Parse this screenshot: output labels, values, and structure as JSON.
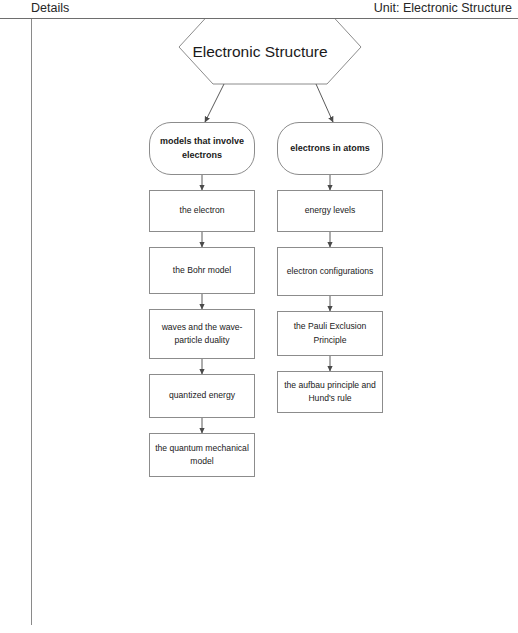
{
  "header": {
    "left_label": "Details",
    "right_label": "Unit: Electronic Structure"
  },
  "diagram": {
    "type": "concept-map",
    "title_node": {
      "label": "Electronic Structure",
      "shape": "hexagon"
    },
    "branches": [
      {
        "label": "models that involve electrons",
        "shape": "rounded-rectangle",
        "children": [
          "the electron",
          "the Bohr model",
          "waves and the wave-particle duality",
          "quantized energy",
          "the quantum mechanical model"
        ]
      },
      {
        "label": "electrons in atoms",
        "shape": "rounded-rectangle",
        "children": [
          "energy levels",
          "electron configurations",
          "the Pauli Exclusion Principle",
          "the aufbau principle and Hund's rule"
        ]
      }
    ]
  },
  "colors": {
    "node_border": "#8c8c8c",
    "edge": "#5a5a5a",
    "rule": "#6e6e6e",
    "text": "#1a1a1a",
    "background": "#ffffff"
  }
}
